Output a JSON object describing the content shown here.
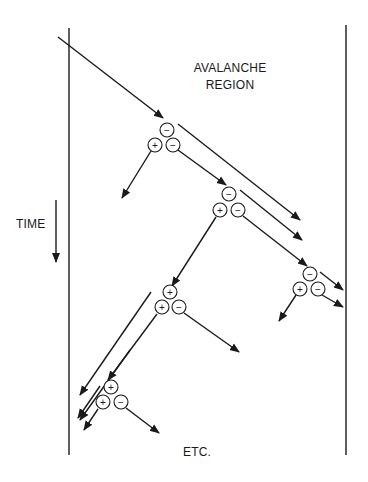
{
  "diagram": {
    "title_line1": "AVALANCHE",
    "title_line2": "REGION",
    "time_label": "TIME",
    "etc_label": "ETC.",
    "colors": {
      "stroke": "#1a1a1a",
      "background": "#ffffff"
    },
    "symbols": {
      "plus": "+",
      "minus": "−"
    },
    "clusters": [
      {
        "id": "cluster-1",
        "top": "−",
        "left": "+",
        "right": "−"
      },
      {
        "id": "cluster-2",
        "top": "−",
        "left": "+",
        "right": "−"
      },
      {
        "id": "cluster-3",
        "top": "−",
        "left": "+",
        "right": "−"
      },
      {
        "id": "cluster-4",
        "top": "+",
        "left": "+",
        "right": "−"
      },
      {
        "id": "cluster-5",
        "top": "+",
        "left": "+",
        "right": "−"
      }
    ]
  }
}
